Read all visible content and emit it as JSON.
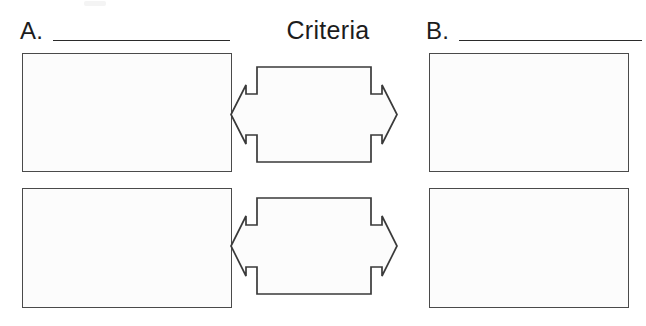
{
  "page": {
    "background_color": "#ffffff",
    "stroke_color": "#3a3a3a",
    "box_fill_color": "#fcfcfc",
    "text_color": "#1c1c1c"
  },
  "header": {
    "left_label": "A.",
    "center_title": "Criteria",
    "right_label": "B.",
    "left_blank_value": "",
    "right_blank_value": ""
  },
  "columns": [
    {
      "id": "a",
      "label": "A.",
      "cells": [
        {
          "id": "a1",
          "value": ""
        },
        {
          "id": "a2",
          "value": ""
        }
      ]
    },
    {
      "id": "b",
      "label": "B.",
      "cells": [
        {
          "id": "b1",
          "value": ""
        },
        {
          "id": "b2",
          "value": ""
        }
      ]
    }
  ],
  "criteria_rows": [
    {
      "id": "criteria-1",
      "value": ""
    },
    {
      "id": "criteria-2",
      "value": ""
    }
  ],
  "icons": {
    "double_arrow": "double-headed-arrow-icon"
  }
}
